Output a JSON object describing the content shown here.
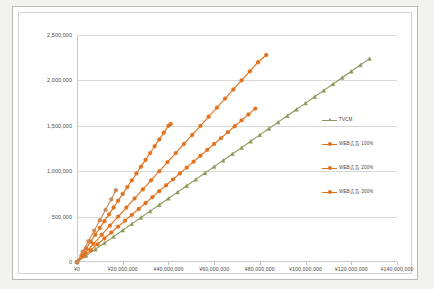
{
  "chart_data": {
    "type": "line",
    "title": "",
    "xlabel": "",
    "ylabel": "",
    "xlim": [
      0,
      140000000
    ],
    "ylim": [
      0,
      2500000
    ],
    "grid": true,
    "legend_position": "right",
    "x_tick_labels": [
      "¥0",
      "¥20,000,000",
      "¥40,000,000",
      "¥60,000,000",
      "¥80,000,000",
      "¥100,000,000",
      "¥120,000,000",
      "¥140,000,000"
    ],
    "x_tick_values": [
      0,
      20000000,
      40000000,
      60000000,
      80000000,
      100000000,
      120000000,
      140000000
    ],
    "y_tick_labels": [
      "0",
      "500,000",
      "1,000,000",
      "1,500,000",
      "2,000,000",
      "2,500,000"
    ],
    "y_tick_values": [
      0,
      500000,
      1000000,
      1500000,
      2000000,
      2500000
    ],
    "series": [
      {
        "name": "TVCM",
        "color": "#8a9a5b",
        "marker": "triangle",
        "points": [
          [
            0,
            0
          ],
          [
            4000000,
            70000
          ],
          [
            8000000,
            140000
          ],
          [
            12000000,
            210000
          ],
          [
            16000000,
            280000
          ],
          [
            20000000,
            350000
          ],
          [
            24000000,
            420000
          ],
          [
            28000000,
            490000
          ],
          [
            32000000,
            560000
          ],
          [
            36000000,
            630000
          ],
          [
            40000000,
            700000
          ],
          [
            44000000,
            770000
          ],
          [
            48000000,
            840000
          ],
          [
            52000000,
            910000
          ],
          [
            56000000,
            980000
          ],
          [
            60000000,
            1050000
          ],
          [
            64000000,
            1120000
          ],
          [
            68000000,
            1190000
          ],
          [
            72000000,
            1260000
          ],
          [
            76000000,
            1330000
          ],
          [
            80000000,
            1400000
          ],
          [
            84000000,
            1470000
          ],
          [
            88000000,
            1540000
          ],
          [
            92000000,
            1610000
          ],
          [
            96000000,
            1680000
          ],
          [
            100000000,
            1750000
          ],
          [
            104000000,
            1820000
          ],
          [
            108000000,
            1890000
          ],
          [
            112000000,
            1960000
          ],
          [
            116000000,
            2030000
          ],
          [
            120000000,
            2100000
          ],
          [
            124000000,
            2170000
          ],
          [
            128000000,
            2240000
          ]
        ]
      },
      {
        "name": "WEB広告 100%",
        "color": "#e2711d",
        "marker": "circle",
        "points": [
          [
            0,
            0
          ],
          [
            3000000,
            65000
          ],
          [
            6000000,
            130000
          ],
          [
            9000000,
            195000
          ],
          [
            12000000,
            260000
          ],
          [
            15000000,
            325000
          ],
          [
            18000000,
            390000
          ],
          [
            21000000,
            455000
          ],
          [
            24000000,
            520000
          ],
          [
            27000000,
            585000
          ],
          [
            30000000,
            650000
          ],
          [
            33000000,
            715000
          ],
          [
            36000000,
            780000
          ],
          [
            39000000,
            845000
          ],
          [
            42000000,
            910000
          ],
          [
            45000000,
            975000
          ],
          [
            48000000,
            1040000
          ],
          [
            51000000,
            1105000
          ],
          [
            54000000,
            1170000
          ],
          [
            57000000,
            1235000
          ],
          [
            60000000,
            1300000
          ],
          [
            63000000,
            1365000
          ],
          [
            66000000,
            1430000
          ],
          [
            69000000,
            1495000
          ],
          [
            72000000,
            1560000
          ],
          [
            75000000,
            1625000
          ],
          [
            78000000,
            1690000
          ]
        ]
      },
      {
        "name": "WEB広告 200%",
        "color": "#e2711d",
        "marker": "circle",
        "points": [
          [
            0,
            0
          ],
          [
            3600000,
            100000
          ],
          [
            7200000,
            200000
          ],
          [
            10800000,
            300000
          ],
          [
            14400000,
            400000
          ],
          [
            18000000,
            500000
          ],
          [
            21600000,
            600000
          ],
          [
            25200000,
            700000
          ],
          [
            28800000,
            800000
          ],
          [
            32400000,
            900000
          ],
          [
            36000000,
            1000000
          ],
          [
            39600000,
            1100000
          ],
          [
            43200000,
            1200000
          ],
          [
            46800000,
            1300000
          ],
          [
            50400000,
            1400000
          ],
          [
            54000000,
            1500000
          ],
          [
            57600000,
            1600000
          ],
          [
            61200000,
            1700000
          ],
          [
            64800000,
            1800000
          ],
          [
            68400000,
            1900000
          ],
          [
            72000000,
            2000000
          ],
          [
            75600000,
            2100000
          ],
          [
            79200000,
            2200000
          ],
          [
            82800000,
            2280000
          ]
        ]
      },
      {
        "name": "WEB広告 300%",
        "color": "#e2711d",
        "marker": "circle",
        "points": [
          [
            0,
            0
          ],
          [
            2000000,
            75000
          ],
          [
            4000000,
            150000
          ],
          [
            6000000,
            225000
          ],
          [
            8000000,
            300000
          ],
          [
            10000000,
            375000
          ],
          [
            12000000,
            450000
          ],
          [
            14000000,
            525000
          ],
          [
            16000000,
            600000
          ],
          [
            18000000,
            675000
          ],
          [
            20000000,
            750000
          ],
          [
            22000000,
            825000
          ],
          [
            24000000,
            900000
          ],
          [
            26000000,
            975000
          ],
          [
            28000000,
            1050000
          ],
          [
            30000000,
            1125000
          ],
          [
            32000000,
            1200000
          ],
          [
            34000000,
            1275000
          ],
          [
            36000000,
            1350000
          ],
          [
            38000000,
            1425000
          ],
          [
            40000000,
            1500000
          ],
          [
            41000000,
            1520000
          ]
        ]
      },
      {
        "name": "WEB広告追加",
        "color": "#cc8855",
        "marker": "circle",
        "points": [
          [
            0,
            0
          ],
          [
            2500000,
            115000
          ],
          [
            5000000,
            230000
          ],
          [
            7500000,
            345000
          ],
          [
            10000000,
            460000
          ],
          [
            12500000,
            575000
          ],
          [
            15000000,
            690000
          ],
          [
            17000000,
            790000
          ]
        ]
      }
    ]
  }
}
